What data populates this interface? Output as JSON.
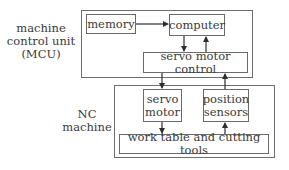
{
  "diagram": {
    "mcu": {
      "label_line1": "machine",
      "label_line2": "control unit",
      "label_line3": "(MCU)",
      "nodes": {
        "memory": "memory",
        "computer": "computer",
        "servo_control": "servo motor control"
      }
    },
    "nc": {
      "label_line1": "NC",
      "label_line2": "machine",
      "nodes": {
        "servo_motor_line1": "servo",
        "servo_motor_line2": "motor",
        "position_sensors_line1": "position",
        "position_sensors_line2": "sensors",
        "work_table": "work table and cutting tools"
      }
    },
    "edges": [
      {
        "from": "memory",
        "to": "computer"
      },
      {
        "from": "computer",
        "to": "servo motor control"
      },
      {
        "from": "servo motor control",
        "to": "computer"
      },
      {
        "from": "servo motor control",
        "to": "servo motor"
      },
      {
        "from": "position sensors",
        "to": "servo motor control"
      },
      {
        "from": "servo motor",
        "to": "work table and cutting tools"
      },
      {
        "from": "work table and cutting tools",
        "to": "position sensors"
      }
    ],
    "colors": {
      "line": "#3a3a3a",
      "border": "#6a6a6a",
      "text": "#3a3a3a"
    }
  }
}
